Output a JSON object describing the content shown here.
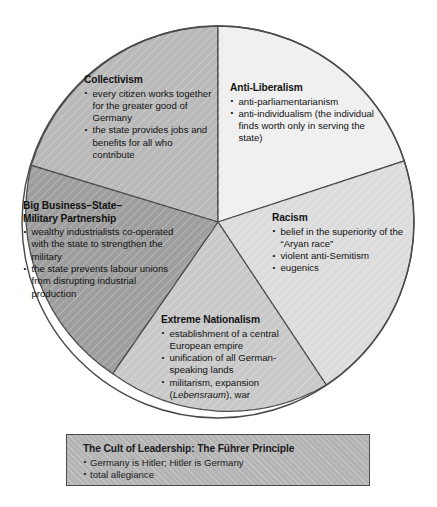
{
  "diagram": {
    "type": "pie-concept-diagram",
    "title_visible": false,
    "colors": {
      "collectivism_fill": "#b9b9b9",
      "antiliberalism_fill": "#efefef",
      "racism_fill": "#dcdcdc",
      "bigbusiness_fill": "#9e9e9e",
      "nationalism_fill": "#c9c9c9",
      "cult_box_fill": "#b4b4b4",
      "outline": "#4a4a4a",
      "text": "#121212"
    },
    "segments": [
      {
        "id": "collectivism",
        "title": "Collectivism",
        "bullets": [
          "every citizen works together for the greater good of Germany",
          "the state provides jobs and benefits for all who contribute"
        ]
      },
      {
        "id": "anti-liberalism",
        "title": "Anti-Liberalism",
        "bullets": [
          "anti-parliamentarianism",
          "anti-individualism (the individual finds worth only in serving the state)"
        ]
      },
      {
        "id": "racism",
        "title": "Racism",
        "bullets": [
          "belief in the superiority of the “Aryan race”",
          "violent anti-Semitism",
          "eugenics"
        ]
      },
      {
        "id": "big-business-state-military-partnership",
        "title_line1": "Big Business–State–",
        "title_line2": "Military Partnership",
        "bullets": [
          "wealthy industrialists co-operated with the state to strengthen the military",
          "the state prevents labour unions from disrupting industrial production"
        ]
      },
      {
        "id": "extreme-nationalism",
        "title": "Extreme Nationalism",
        "bullets": [
          "establishment of a central European empire",
          "unification of all German-speaking lands"
        ],
        "bullet_militarism_pre": "militarism, expansion (",
        "bullet_militarism_italic": "Lebensraum",
        "bullet_militarism_post": "), war"
      }
    ],
    "cult_box": {
      "title": "The Cult of Leadership: The Führer Principle",
      "bullets": [
        "Germany is Hitler; Hitler is Germany",
        "total allegiance"
      ]
    }
  }
}
